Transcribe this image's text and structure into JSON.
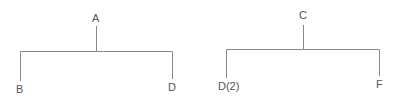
{
  "diagram": {
    "type": "tree",
    "line_color": "#8a8a8a",
    "text_color": "#555555",
    "trees": [
      {
        "root": "A",
        "children": [
          "B",
          "D"
        ]
      },
      {
        "root": "C",
        "children": [
          "D(2)",
          "F"
        ]
      }
    ]
  }
}
